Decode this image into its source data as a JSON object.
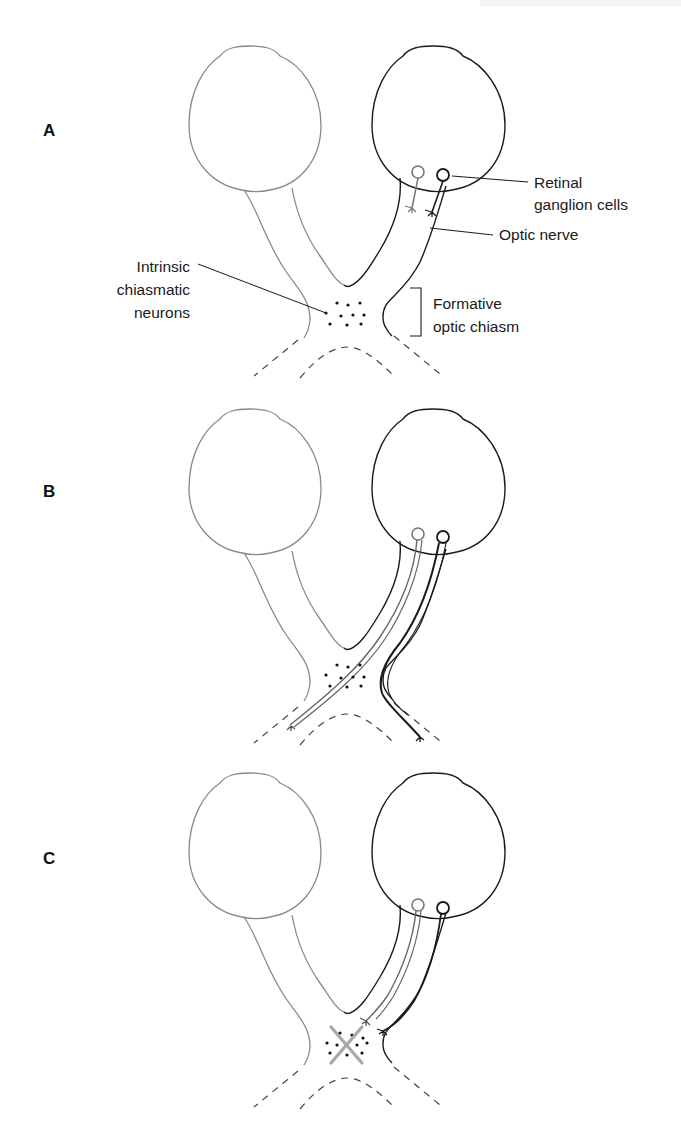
{
  "figure": {
    "panels": [
      {
        "id": "A",
        "label": "A",
        "annotations": {
          "retinal_ganglion_cells": [
            "Retinal",
            "ganglion cells"
          ],
          "optic_nerve": "Optic nerve",
          "intrinsic_chiasmatic_neurons": [
            "Intrinsic",
            "chiasmatic",
            "neurons"
          ],
          "formative_optic_chiasm": [
            "Formative",
            "optic chiasm"
          ]
        }
      },
      {
        "id": "B",
        "label": "B"
      },
      {
        "id": "C",
        "label": "C"
      }
    ],
    "colors": {
      "left_eye_outline": "#8a8a8a",
      "right_eye_outline": "#1a1a1a",
      "gray_axon": "#777777",
      "dark_axon": "#1a1a1a",
      "ablation_x": "#a8a8a8"
    }
  }
}
